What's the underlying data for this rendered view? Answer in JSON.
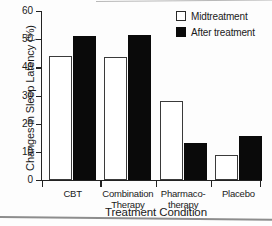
{
  "chart_data": {
    "type": "bar",
    "title": "",
    "xlabel": "Treatment Condition",
    "ylabel": "Changes in Sleep Latency (%)",
    "categories": [
      "CBT",
      "Combination\nTherapy",
      "Pharmaco-\ntherapy",
      "Placebo"
    ],
    "ylim": [
      0,
      60
    ],
    "yticks": [
      0,
      10,
      20,
      30,
      40,
      50,
      60
    ],
    "ytick_labels": [
      "0",
      "10",
      "20",
      "30",
      "40",
      "50",
      "60"
    ],
    "grid": false,
    "legend_position": "top-right",
    "series": [
      {
        "name": "Midtreatment",
        "color": "#ffffff",
        "edgecolor": "#3a3a3a",
        "values": [
          44,
          43.5,
          28,
          9
        ]
      },
      {
        "name": "After treatment",
        "color": "#0a0a0a",
        "edgecolor": "#0a0a0a",
        "values": [
          51,
          51.5,
          13,
          15.5
        ]
      }
    ]
  },
  "legend": {
    "entries": [
      {
        "label": "Midtreatment",
        "swatch": "open-square-swatch"
      },
      {
        "label": "After treatment",
        "swatch": "filled-square-swatch"
      }
    ]
  },
  "axes": {
    "y_title": "Changes in Sleep Latency (%)",
    "x_title": "Treatment Condition"
  }
}
